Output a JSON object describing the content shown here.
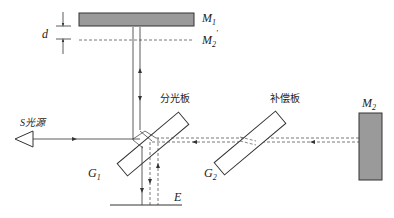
{
  "diagram": {
    "type": "michelson-interferometer",
    "colors": {
      "mirror_fill": "#9a9a9a",
      "line": "#333333",
      "dashed": "#555555"
    },
    "labels": {
      "m1": "M",
      "m1_sub": "1",
      "m2_prime": "M",
      "m2_prime_sub": "2",
      "m2_prime_mark": "'",
      "m2": "M",
      "m2_sub": "2",
      "d": "d",
      "source": "S光源",
      "beam_splitter": "分光板",
      "compensator": "补偿板",
      "g1": "G",
      "g1_sub": "1",
      "g2": "G",
      "g2_sub": "2",
      "e": "E"
    }
  }
}
